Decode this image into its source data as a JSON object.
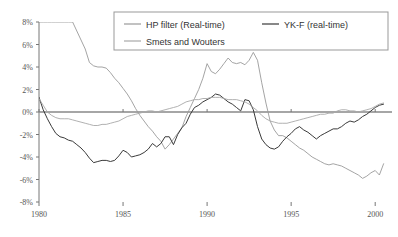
{
  "chart_data": {
    "type": "line",
    "title": "",
    "subtitle": "",
    "xlabel": "",
    "ylabel": "",
    "xlim": [
      1980,
      2001
    ],
    "ylim": [
      -8,
      8
    ],
    "grid": false,
    "legend_position": "top-center",
    "x_ticks": [
      "1980",
      "1985",
      "1990",
      "1995",
      "2000"
    ],
    "x_tick_values": [
      1980,
      1985,
      1990,
      1995,
      2000
    ],
    "y_ticks": [
      "8%",
      "6%",
      "4%",
      "2%",
      "0%",
      "-2%",
      "-4%",
      "-6%",
      "-8%"
    ],
    "y_tick_values": [
      8,
      6,
      4,
      2,
      0,
      -2,
      -4,
      -6,
      -8
    ],
    "zero_reference_line": 0,
    "series": [
      {
        "name": "HP filter (Real-time)",
        "color": "#9a9a9a",
        "x": [
          1980.0,
          1980.25,
          1980.5,
          1980.75,
          1981.0,
          1981.25,
          1981.5,
          1981.75,
          1982.0,
          1982.25,
          1982.5,
          1982.75,
          1983.0,
          1983.25,
          1983.5,
          1983.75,
          1984.0,
          1984.25,
          1984.5,
          1984.75,
          1985.0,
          1985.25,
          1985.5,
          1985.75,
          1986.0,
          1986.25,
          1986.5,
          1986.75,
          1987.0,
          1987.25,
          1987.5,
          1987.75,
          1988.0,
          1988.25,
          1988.5,
          1988.75,
          1989.0,
          1989.25,
          1989.5,
          1989.75,
          1990.0,
          1990.25,
          1990.5,
          1990.75,
          1991.0,
          1991.25,
          1991.5,
          1991.75,
          1992.0,
          1992.25,
          1992.5,
          1992.75,
          1993.0,
          1993.25,
          1993.5,
          1993.75,
          1994.0,
          1994.25,
          1994.5,
          1994.75,
          1995.0,
          1995.25,
          1995.5,
          1995.75,
          1996.0,
          1996.25,
          1996.5,
          1996.75,
          1997.0,
          1997.25,
          1997.5,
          1997.75,
          1998.0,
          1998.25,
          1998.5,
          1998.75,
          1999.0,
          1999.25,
          1999.5,
          1999.75,
          2000.0,
          2000.25,
          2000.5
        ],
        "y": [
          9.8,
          9.6,
          9.4,
          9.2,
          9.0,
          8.8,
          8.6,
          8.4,
          8.0,
          7.2,
          6.4,
          5.6,
          4.4,
          4.1,
          4.0,
          4.0,
          3.9,
          3.5,
          3.0,
          2.6,
          2.1,
          1.6,
          1.0,
          0.3,
          -0.3,
          -0.8,
          -1.3,
          -1.7,
          -2.2,
          -2.6,
          -3.3,
          -2.9,
          -2.4,
          -1.9,
          -1.4,
          -0.4,
          0.4,
          1.2,
          2.0,
          3.0,
          4.3,
          3.6,
          3.4,
          3.8,
          4.3,
          4.8,
          4.4,
          4.3,
          4.4,
          4.2,
          4.6,
          5.3,
          4.6,
          2.6,
          0.8,
          -0.8,
          -1.6,
          -2.1,
          -2.1,
          -2.3,
          -2.6,
          -2.9,
          -3.2,
          -3.4,
          -3.7,
          -4.0,
          -4.2,
          -4.4,
          -4.6,
          -4.7,
          -4.6,
          -4.7,
          -4.8,
          -5.0,
          -5.2,
          -5.4,
          -5.6,
          -5.9,
          -5.7,
          -5.4,
          -5.2,
          -5.6,
          -4.6
        ]
      },
      {
        "name": "YK-F (real-time)",
        "color": "#3a3a3a",
        "x": [
          1980.0,
          1980.25,
          1980.5,
          1980.75,
          1981.0,
          1981.25,
          1981.5,
          1981.75,
          1982.0,
          1982.25,
          1982.5,
          1982.75,
          1983.0,
          1983.25,
          1983.5,
          1983.75,
          1984.0,
          1984.25,
          1984.5,
          1984.75,
          1985.0,
          1985.25,
          1985.5,
          1985.75,
          1986.0,
          1986.25,
          1986.5,
          1986.75,
          1987.0,
          1987.25,
          1987.5,
          1987.75,
          1988.0,
          1988.25,
          1988.5,
          1988.75,
          1989.0,
          1989.25,
          1989.5,
          1989.75,
          1990.0,
          1990.25,
          1990.5,
          1990.75,
          1991.0,
          1991.25,
          1991.5,
          1991.75,
          1992.0,
          1992.25,
          1992.5,
          1992.75,
          1993.0,
          1993.25,
          1993.5,
          1993.75,
          1994.0,
          1994.25,
          1994.5,
          1994.75,
          1995.0,
          1995.25,
          1995.5,
          1995.75,
          1996.0,
          1996.25,
          1996.5,
          1996.75,
          1997.0,
          1997.25,
          1997.5,
          1997.75,
          1998.0,
          1998.25,
          1998.5,
          1998.75,
          1999.0,
          1999.25,
          1999.5,
          1999.75,
          2000.0,
          2000.25,
          2000.5
        ],
        "y": [
          1.3,
          0.2,
          -0.6,
          -1.3,
          -1.9,
          -2.2,
          -2.3,
          -2.5,
          -2.6,
          -2.9,
          -3.2,
          -3.6,
          -4.1,
          -4.5,
          -4.4,
          -4.3,
          -4.3,
          -4.4,
          -4.3,
          -3.9,
          -3.4,
          -3.6,
          -4.0,
          -3.9,
          -3.8,
          -3.6,
          -3.3,
          -2.8,
          -3.1,
          -2.8,
          -2.2,
          -2.2,
          -2.9,
          -2.0,
          -1.4,
          -1.0,
          -0.2,
          0.4,
          0.6,
          0.9,
          1.1,
          1.3,
          1.6,
          1.5,
          1.2,
          0.9,
          0.7,
          0.4,
          0.1,
          1.1,
          1.0,
          0.2,
          -1.3,
          -2.4,
          -2.9,
          -3.2,
          -3.3,
          -3.1,
          -2.6,
          -2.2,
          -1.9,
          -1.5,
          -1.3,
          -1.6,
          -1.8,
          -2.1,
          -2.4,
          -2.1,
          -1.9,
          -1.7,
          -1.5,
          -1.5,
          -1.3,
          -1.0,
          -0.8,
          -0.9,
          -0.7,
          -0.4,
          -0.2,
          0.1,
          0.4,
          0.6,
          0.7
        ]
      },
      {
        "name": "Smets and Wouters",
        "color": "#a8a8a8",
        "x": [
          1980.0,
          1980.25,
          1980.5,
          1980.75,
          1981.0,
          1981.25,
          1981.5,
          1981.75,
          1982.0,
          1982.25,
          1982.5,
          1982.75,
          1983.0,
          1983.25,
          1983.5,
          1983.75,
          1984.0,
          1984.25,
          1984.5,
          1984.75,
          1985.0,
          1985.25,
          1985.5,
          1985.75,
          1986.0,
          1986.25,
          1986.5,
          1986.75,
          1987.0,
          1987.25,
          1987.5,
          1987.75,
          1988.0,
          1988.25,
          1988.5,
          1988.75,
          1989.0,
          1989.25,
          1989.5,
          1989.75,
          1990.0,
          1990.25,
          1990.5,
          1990.75,
          1991.0,
          1991.25,
          1991.5,
          1991.75,
          1992.0,
          1992.25,
          1992.5,
          1992.75,
          1993.0,
          1993.25,
          1993.5,
          1993.75,
          1994.0,
          1994.25,
          1994.5,
          1994.75,
          1995.0,
          1995.25,
          1995.5,
          1995.75,
          1996.0,
          1996.25,
          1996.5,
          1996.75,
          1997.0,
          1997.25,
          1997.5,
          1997.75,
          1998.0,
          1998.25,
          1998.5,
          1998.75,
          1999.0,
          1999.25,
          1999.5,
          1999.75,
          2000.0,
          2000.25,
          2000.5
        ],
        "y": [
          1.2,
          0.6,
          0.0,
          -0.3,
          -0.5,
          -0.6,
          -0.6,
          -0.6,
          -0.7,
          -0.8,
          -0.9,
          -1.0,
          -1.1,
          -1.2,
          -1.2,
          -1.1,
          -1.1,
          -1.0,
          -0.9,
          -0.8,
          -0.6,
          -0.4,
          -0.3,
          -0.2,
          -0.1,
          0.0,
          0.1,
          0.1,
          0.0,
          0.1,
          0.2,
          0.3,
          0.4,
          0.5,
          0.7,
          0.9,
          1.0,
          1.1,
          1.1,
          1.2,
          1.2,
          1.3,
          1.3,
          1.3,
          1.2,
          1.1,
          1.1,
          1.1,
          1.0,
          0.9,
          0.7,
          0.4,
          0.1,
          -0.3,
          -0.6,
          -0.8,
          -0.9,
          -1.0,
          -1.0,
          -1.0,
          -0.9,
          -0.8,
          -0.7,
          -0.6,
          -0.5,
          -0.4,
          -0.3,
          -0.2,
          -0.2,
          -0.1,
          -0.1,
          0.1,
          0.2,
          0.2,
          0.1,
          0.1,
          0.0,
          0.1,
          0.2,
          0.3,
          0.5,
          0.7,
          0.8
        ]
      }
    ]
  },
  "legend": {
    "entries": [
      {
        "label": "HP filter (Real-time)",
        "color": "#9a9a9a"
      },
      {
        "label": "YK-F (real-time)",
        "color": "#3a3a3a"
      },
      {
        "label": "Smets and Wouters",
        "color": "#a8a8a8"
      }
    ]
  },
  "colors": {
    "background": "#ffffff",
    "axis": "#777777",
    "zero_line": "#888888",
    "tick_text": "#555555",
    "legend_border": "#999999"
  }
}
